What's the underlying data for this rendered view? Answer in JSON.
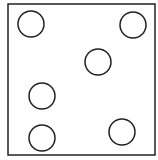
{
  "diagram": {
    "frame": {
      "x": 8,
      "y": 4,
      "width": 147,
      "height": 151,
      "stroke": "#222222",
      "stroke_width": 1.5
    },
    "circle_style": {
      "radius": 13,
      "stroke": "#222222",
      "stroke_width": 1.5,
      "fill": "none"
    },
    "circles": [
      {
        "cx": 31,
        "cy": 24
      },
      {
        "cx": 133,
        "cy": 25
      },
      {
        "cx": 98,
        "cy": 62
      },
      {
        "cx": 42,
        "cy": 96
      },
      {
        "cx": 42,
        "cy": 138
      },
      {
        "cx": 122,
        "cy": 132
      }
    ]
  }
}
